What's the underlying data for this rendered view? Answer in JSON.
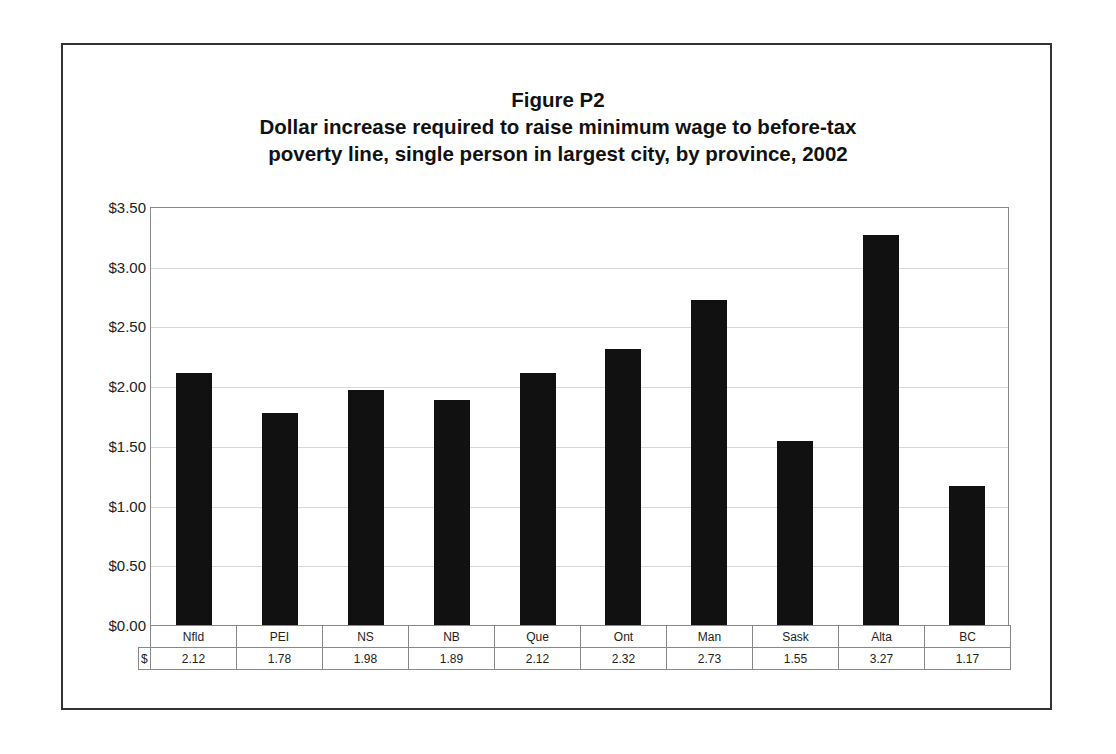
{
  "chart_data": {
    "type": "bar",
    "title": "Figure P2",
    "subtitle_lines": [
      "Dollar increase required to raise minimum wage to before-tax",
      "poverty line, single person in largest city, by province, 2002"
    ],
    "categories": [
      "Nfld",
      "PEI",
      "NS",
      "NB",
      "Que",
      "Ont",
      "Man",
      "Sask",
      "Alta",
      "BC"
    ],
    "series": [
      {
        "name": "$",
        "values": [
          2.12,
          1.78,
          1.98,
          1.89,
          2.12,
          2.32,
          2.73,
          1.55,
          3.27,
          1.17
        ]
      }
    ],
    "xlabel": "",
    "ylabel": "",
    "ylim": [
      0,
      3.5
    ],
    "yticks": [
      "$0.00",
      "$0.50",
      "$1.00",
      "$1.50",
      "$2.00",
      "$2.50",
      "$3.00",
      "$3.50"
    ],
    "grid": true,
    "legend": "data table below chart",
    "bar_color": "#111111",
    "data_table": {
      "row_label": "$",
      "values": [
        "2.12",
        "1.78",
        "1.98",
        "1.89",
        "2.12",
        "2.32",
        "2.73",
        "1.55",
        "3.27",
        "1.17"
      ]
    }
  }
}
